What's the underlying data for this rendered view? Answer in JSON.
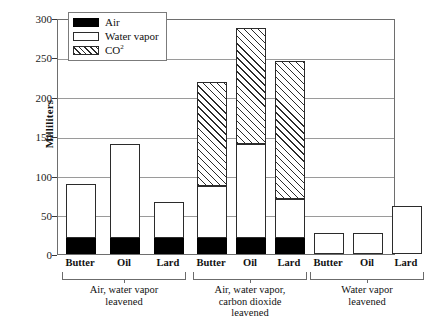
{
  "chart_data": {
    "type": "bar",
    "subtype": "stacked-grouped",
    "title": "",
    "xlabel": "",
    "ylabel": "Milliliters",
    "ylim": [
      0,
      300
    ],
    "yticks": [
      0,
      50,
      100,
      150,
      200,
      250,
      300
    ],
    "grid": true,
    "legend_position": "top-left",
    "series": [
      {
        "name": "Air",
        "pattern": "solid-black",
        "values": [
          20,
          20,
          20,
          20,
          20,
          20,
          0,
          0,
          0
        ]
      },
      {
        "name": "Water vapor",
        "pattern": "white",
        "values": [
          70,
          121,
          47,
          67,
          121,
          51,
          27,
          27,
          61
        ]
      },
      {
        "name": "CO2",
        "pattern": "diagonal-hatch",
        "values": [
          0,
          0,
          0,
          133,
          149,
          176,
          0,
          0,
          0
        ]
      }
    ],
    "categories": [
      "Butter",
      "Oil",
      "Lard",
      "Butter",
      "Oil",
      "Lard",
      "Butter",
      "Oil",
      "Lard"
    ],
    "totals": [
      90,
      141,
      67,
      220,
      290,
      247,
      27,
      27,
      61
    ],
    "groups": [
      {
        "label": "Air, water vapor leavened",
        "label_lines": [
          "Air, water vapor",
          "leavened"
        ],
        "categories": [
          "Butter",
          "Oil",
          "Lard"
        ]
      },
      {
        "label": "Air, water vapor, carbon dioxide leavened",
        "label_lines": [
          "Air, water vapor,",
          "carbon dioxide",
          "leavened"
        ],
        "categories": [
          "Butter",
          "Oil",
          "Lard"
        ]
      },
      {
        "label": "Water vapor leavened",
        "label_lines": [
          "Water vapor",
          "leavened"
        ],
        "categories": [
          "Butter",
          "Oil",
          "Lard"
        ]
      }
    ]
  },
  "axis": {
    "y_title": "Milliliters",
    "y_labels": [
      "300",
      "250",
      "200",
      "150",
      "100",
      "50",
      "0"
    ]
  },
  "legend": {
    "items": [
      {
        "label": "Air",
        "swatch": "solid-black-swatch"
      },
      {
        "label": "Water vapor",
        "swatch": "white-swatch"
      },
      {
        "label": "CO",
        "sup": "2",
        "swatch": "hatched-swatch"
      }
    ]
  },
  "colors": {
    "air": "#000000",
    "water_vapor": "#ffffff",
    "co2_hatch": "#2b2b2b",
    "frame": "#6e6e6e",
    "gridline": "#9a9a9a",
    "text": "#111111"
  },
  "bars": [
    {
      "name": "butter-group1",
      "group": 0,
      "category": "Butter",
      "x": 8,
      "air": 20,
      "water": 70,
      "co2": 0
    },
    {
      "name": "oil-group1",
      "group": 0,
      "category": "Oil",
      "x": 52,
      "air": 20,
      "water": 121,
      "co2": 0
    },
    {
      "name": "lard-group1",
      "group": 0,
      "category": "Lard",
      "x": 96,
      "air": 20,
      "water": 47,
      "co2": 0
    },
    {
      "name": "butter-group2",
      "group": 1,
      "category": "Butter",
      "x": 139,
      "air": 20,
      "water": 67,
      "co2": 133
    },
    {
      "name": "oil-group2",
      "group": 1,
      "category": "Oil",
      "x": 178,
      "air": 20,
      "water": 121,
      "co2": 149
    },
    {
      "name": "lard-group2",
      "group": 1,
      "category": "Lard",
      "x": 217,
      "air": 20,
      "water": 51,
      "co2": 176
    },
    {
      "name": "butter-group3",
      "group": 2,
      "category": "Butter",
      "x": 256,
      "air": 0,
      "water": 27,
      "co2": 0
    },
    {
      "name": "oil-group3",
      "group": 2,
      "category": "Oil",
      "x": 295,
      "air": 0,
      "water": 27,
      "co2": 0
    },
    {
      "name": "lard-group3",
      "group": 2,
      "category": "Lard",
      "x": 334,
      "air": 0,
      "water": 61,
      "co2": 0
    }
  ]
}
